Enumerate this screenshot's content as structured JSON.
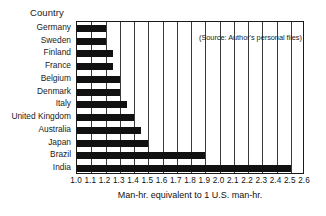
{
  "chart_data": {
    "type": "bar",
    "orientation": "horizontal",
    "title": "",
    "ylabel": "Country",
    "xlabel": "Man-hr. equivalent to 1 U.S. man-hr.",
    "xlim": [
      1.0,
      2.6
    ],
    "xticks": [
      "1.0",
      "1.1",
      "1.2",
      "1.3",
      "1.4",
      "1.5",
      "1.6",
      "1.7",
      "1.8",
      "1.9",
      "2.0",
      "2.1",
      "2.2",
      "2.3",
      "2.4",
      "2.5",
      "2.6"
    ],
    "xtick_values": [
      1.0,
      1.1,
      1.2,
      1.3,
      1.4,
      1.5,
      1.6,
      1.7,
      1.8,
      1.9,
      2.0,
      2.1,
      2.2,
      2.3,
      2.4,
      2.5,
      2.6
    ],
    "grid": true,
    "grid_axis": "x",
    "legend": "none",
    "bar_color": "#111111",
    "categories": [
      "Germany",
      "Sweden",
      "Finland",
      "France",
      "Belgium",
      "Denmark",
      "Italy",
      "United Kingdom",
      "Australia",
      "Japan",
      "Brazil",
      "India"
    ],
    "values": [
      1.2,
      1.2,
      1.25,
      1.25,
      1.3,
      1.3,
      1.35,
      1.4,
      1.45,
      1.5,
      1.9,
      2.5
    ],
    "annotations": [
      {
        "name": "source-note",
        "text": "(Source: Author's personal files)"
      }
    ]
  },
  "axis": {
    "y_caption": "Country",
    "x_title": "Man-hr. equivalent to 1 U.S. man-hr."
  },
  "note": {
    "source": "(Source: Author's personal files)"
  }
}
